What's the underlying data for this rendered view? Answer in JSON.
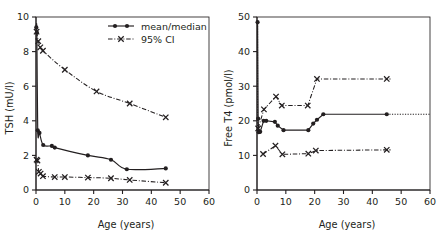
{
  "figure": {
    "background": "#ffffff",
    "ink": "#231f20",
    "panels": [
      "tsh-panel",
      "freet4-panel"
    ]
  },
  "legend": {
    "position": "top-right-of-left-panel",
    "items": [
      {
        "label": "mean/median",
        "marker": "filled-circle",
        "line": "solid"
      },
      {
        "label": "95% CI",
        "marker": "cross",
        "line": "dash-dot"
      }
    ]
  },
  "chart_data": [
    {
      "id": "tsh-panel",
      "type": "line",
      "title": "",
      "xlabel": "Age (years)",
      "ylabel": "TSH (mU/l)",
      "xlim": [
        0,
        60
      ],
      "ylim": [
        0,
        10
      ],
      "xticks": [
        0,
        10,
        20,
        30,
        40,
        50,
        60
      ],
      "yticks": [
        0,
        2,
        4,
        6,
        8,
        10
      ],
      "grid": false,
      "series": [
        {
          "name": "mean/median",
          "style": "solid",
          "marker": "filled-circle",
          "x": [
            0.1,
            0.3,
            0.6,
            1.2,
            2.5,
            5.5,
            6.5,
            18,
            26,
            31.5,
            45
          ],
          "y": [
            9.4,
            9.1,
            3.45,
            3.3,
            2.6,
            2.55,
            2.45,
            2.0,
            1.75,
            1.2,
            1.25
          ]
        },
        {
          "name": "95% CI upper",
          "style": "dash-dot",
          "marker": "cross",
          "x": [
            0.2,
            0.8,
            1.5,
            2.4,
            10,
            21,
            32.5,
            45
          ],
          "y": [
            9.15,
            8.6,
            8.25,
            8.05,
            6.95,
            5.7,
            5.0,
            4.2
          ]
        },
        {
          "name": "95% CI lower",
          "style": "dash-dot",
          "marker": "cross",
          "x": [
            0.2,
            0.5,
            1.0,
            1.6,
            2.4,
            6.5,
            10,
            18,
            26,
            32.5,
            45
          ],
          "y": [
            1.75,
            1.7,
            1.05,
            0.95,
            0.8,
            0.75,
            0.75,
            0.72,
            0.68,
            0.58,
            0.42
          ]
        }
      ]
    },
    {
      "id": "freet4-panel",
      "type": "line",
      "title": "",
      "xlabel": "Age (years)",
      "ylabel": "Free T4 (pmol/l)",
      "xlim": [
        0,
        60
      ],
      "ylim": [
        0,
        50
      ],
      "xticks": [
        0,
        10,
        20,
        30,
        40,
        50,
        60
      ],
      "yticks": [
        0,
        10,
        20,
        30,
        40,
        50
      ],
      "grid": false,
      "series": [
        {
          "name": "mean/median",
          "style": "solid",
          "marker": "filled-circle",
          "x": [
            0.2,
            0.4,
            0.6,
            0.8,
            1.1,
            2.3,
            3.2,
            6.2,
            7.2,
            9.2,
            17.8,
            19.5,
            20.8,
            23.0,
            45.0
          ],
          "y": [
            48.5,
            20.6,
            16.7,
            16.9,
            16.8,
            20.0,
            20.0,
            19.7,
            18.6,
            17.3,
            17.3,
            19.2,
            20.3,
            21.9,
            21.9
          ]
        },
        {
          "name": "95% CI upper",
          "style": "dash-dot",
          "marker": "cross",
          "x": [
            0.4,
            2.4,
            6.6,
            8.6,
            17.6,
            20.8,
            45.0
          ],
          "y": [
            17.8,
            23.3,
            27.0,
            24.4,
            24.4,
            32.1,
            32.1
          ]
        },
        {
          "name": "95% CI lower",
          "style": "dash-dot",
          "marker": "cross",
          "x": [
            2.1,
            6.4,
            8.8,
            17.8,
            20.4,
            45.0
          ],
          "y": [
            10.4,
            12.8,
            10.3,
            10.5,
            11.4,
            11.6
          ]
        }
      ],
      "annotations": [
        {
          "kind": "vertical-dotted-line",
          "x": 0.2,
          "from_y": 17,
          "to_y": 48.5
        },
        {
          "kind": "horizontal-dotted-extension",
          "y": 21.9,
          "from_x": 45,
          "to_x": 60
        },
        {
          "kind": "horizontal-dotted-extension",
          "y": 32.1,
          "from_x": 45,
          "to_x": 46.5
        },
        {
          "kind": "horizontal-dotted-extension",
          "y": 11.6,
          "from_x": 45,
          "to_x": 46.5
        }
      ]
    }
  ]
}
